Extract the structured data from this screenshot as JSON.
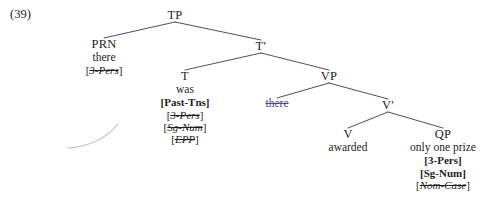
{
  "figure": {
    "example_number": "(39)",
    "type": "syntax-tree"
  },
  "nodes": {
    "tp": {
      "label": "TP"
    },
    "prn": {
      "label": "PRN",
      "word": "there"
    },
    "tbar": {
      "label": "T′"
    },
    "t": {
      "label": "T",
      "word": "was"
    },
    "vp": {
      "label": "VP"
    },
    "vp_trace": {
      "word": "there"
    },
    "vbar": {
      "label": "V′"
    },
    "v": {
      "label": "V",
      "word": "awarded"
    },
    "qp": {
      "label": "QP",
      "word": "only one prize"
    }
  },
  "features": {
    "prn": [
      {
        "text": "[3-Pers]",
        "open": "[",
        "inner": "3-Pers",
        "close": "]",
        "struck": true,
        "bold": false
      }
    ],
    "t": [
      {
        "text": "[Past-Tns]",
        "open": "[",
        "inner": "Past-Tns",
        "close": "]",
        "struck": false,
        "bold": true
      },
      {
        "text": "[3-Pers]",
        "open": "[",
        "inner": "3-Pers",
        "close": "]",
        "struck": true,
        "bold": false
      },
      {
        "text": "[Sg-Num]",
        "open": "[",
        "inner": "Sg-Num",
        "close": "]",
        "struck": true,
        "bold": false
      },
      {
        "text": "[EPP]",
        "open": "[",
        "inner": "EPP",
        "close": "]",
        "struck": true,
        "bold": false
      }
    ],
    "qp": [
      {
        "text": "[3-Pers]",
        "open": "[",
        "inner": "3-Pers",
        "close": "]",
        "struck": false,
        "bold": true
      },
      {
        "text": "[Sg-Num]",
        "open": "[",
        "inner": "Sg-Num",
        "close": "]",
        "struck": false,
        "bold": true
      },
      {
        "text": "[Nom-Case]",
        "open": "[",
        "inner": "Nom-Case",
        "close": "]",
        "struck": true,
        "bold": false
      }
    ]
  },
  "colors": {
    "ink": "#231f20",
    "branch": "#3a3a52",
    "trace": "#4a4a8c",
    "movement_arc": "#b9b9c4"
  }
}
